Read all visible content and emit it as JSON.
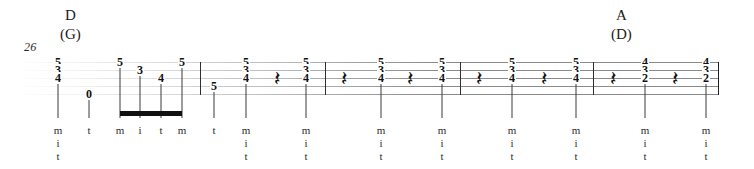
{
  "score": {
    "measure_number": "26",
    "staff": {
      "type": "guitar-tablature",
      "line_count": 5,
      "top_y": 62,
      "line_spacing": 8,
      "left_x": 14,
      "right_x": 719
    },
    "chord_labels": [
      {
        "name": "D",
        "alternate": "(G)",
        "x": 60,
        "y": 8
      },
      {
        "name": "A",
        "alternate": "(D)",
        "x": 611,
        "y": 8
      }
    ],
    "barlines": [
      200,
      325,
      460,
      593,
      718
    ],
    "end_barline": 718,
    "colors": {
      "staff_line": "#8a8a8a",
      "note": "#111111",
      "barline": "#2e2e2e",
      "fingering": "#2b2b2b"
    },
    "measures": [
      {
        "index": 1,
        "events": [
          {
            "kind": "chord",
            "x": 58,
            "frets": [
              {
                "value": "5",
                "string": 1
              },
              {
                "value": "3",
                "string": 2
              },
              {
                "value": "4",
                "string": 3
              }
            ],
            "stem": true,
            "fingering": [
              "m",
              "i",
              "t"
            ]
          },
          {
            "kind": "note",
            "x": 89,
            "frets": [
              {
                "value": "0",
                "string": 5
              }
            ],
            "stem": true,
            "fingering": [
              "t"
            ]
          },
          {
            "kind": "note",
            "x": 120,
            "frets": [
              {
                "value": "5",
                "string": 1
              }
            ],
            "stem": true,
            "beamed": true,
            "fingering": [
              "m"
            ]
          },
          {
            "kind": "note",
            "x": 140,
            "frets": [
              {
                "value": "3",
                "string": 2
              }
            ],
            "stem": true,
            "beamed": true,
            "fingering": [
              "i"
            ]
          },
          {
            "kind": "note",
            "x": 161,
            "frets": [
              {
                "value": "4",
                "string": 3
              }
            ],
            "stem": true,
            "beamed": true,
            "fingering": [
              "t"
            ]
          },
          {
            "kind": "note",
            "x": 182,
            "frets": [
              {
                "value": "5",
                "string": 1
              }
            ],
            "stem": true,
            "beamed": true,
            "fingering": [
              "m"
            ]
          }
        ],
        "beams": [
          {
            "from_x": 120,
            "to_x": 182,
            "y": 111
          }
        ]
      },
      {
        "index": 2,
        "events": [
          {
            "kind": "note",
            "x": 214,
            "frets": [
              {
                "value": "5",
                "string": 4
              }
            ],
            "stem": true,
            "fingering": [
              "t"
            ]
          },
          {
            "kind": "chord",
            "x": 246,
            "frets": [
              {
                "value": "5",
                "string": 1
              },
              {
                "value": "3",
                "string": 2
              },
              {
                "value": "4",
                "string": 3
              }
            ],
            "stem": true,
            "fingering": [
              "m",
              "i",
              "t"
            ]
          },
          {
            "kind": "rest",
            "x": 277,
            "glyph": "𝄽"
          },
          {
            "kind": "chord",
            "x": 306,
            "frets": [
              {
                "value": "5",
                "string": 1
              },
              {
                "value": "3",
                "string": 2
              },
              {
                "value": "4",
                "string": 3
              }
            ],
            "stem": true,
            "fingering": [
              "m",
              "i",
              "t"
            ]
          }
        ],
        "beams": []
      },
      {
        "index": 3,
        "events": [
          {
            "kind": "rest",
            "x": 344,
            "glyph": "𝄽"
          },
          {
            "kind": "chord",
            "x": 381,
            "frets": [
              {
                "value": "5",
                "string": 1
              },
              {
                "value": "3",
                "string": 2
              },
              {
                "value": "4",
                "string": 3
              }
            ],
            "stem": true,
            "fingering": [
              "m",
              "i",
              "t"
            ]
          },
          {
            "kind": "rest",
            "x": 410,
            "glyph": "𝄽"
          },
          {
            "kind": "chord",
            "x": 442,
            "frets": [
              {
                "value": "5",
                "string": 1
              },
              {
                "value": "3",
                "string": 2
              },
              {
                "value": "4",
                "string": 3
              }
            ],
            "stem": true,
            "fingering": [
              "m",
              "i",
              "t"
            ]
          }
        ],
        "beams": []
      },
      {
        "index": 4,
        "events": [
          {
            "kind": "rest",
            "x": 479,
            "glyph": "𝄽"
          },
          {
            "kind": "chord",
            "x": 512,
            "frets": [
              {
                "value": "5",
                "string": 1
              },
              {
                "value": "3",
                "string": 2
              },
              {
                "value": "4",
                "string": 3
              }
            ],
            "stem": true,
            "fingering": [
              "m",
              "i",
              "t"
            ]
          },
          {
            "kind": "rest",
            "x": 544,
            "glyph": "𝄽"
          },
          {
            "kind": "chord",
            "x": 576,
            "frets": [
              {
                "value": "5",
                "string": 1
              },
              {
                "value": "3",
                "string": 2
              },
              {
                "value": "4",
                "string": 3
              }
            ],
            "stem": true,
            "fingering": [
              "m",
              "i",
              "t"
            ]
          }
        ],
        "beams": []
      },
      {
        "index": 5,
        "events": [
          {
            "kind": "rest",
            "x": 613,
            "glyph": "𝄽"
          },
          {
            "kind": "chord",
            "x": 645,
            "frets": [
              {
                "value": "4",
                "string": 1
              },
              {
                "value": "3",
                "string": 2
              },
              {
                "value": "2",
                "string": 3
              }
            ],
            "stem": true,
            "fingering": [
              "m",
              "i",
              "t"
            ]
          },
          {
            "kind": "rest",
            "x": 675,
            "glyph": "𝄽"
          },
          {
            "kind": "chord",
            "x": 706,
            "frets": [
              {
                "value": "4",
                "string": 1
              },
              {
                "value": "3",
                "string": 2
              },
              {
                "value": "2",
                "string": 3
              }
            ],
            "stem": true,
            "fingering": [
              "m",
              "i",
              "t"
            ]
          }
        ],
        "beams": []
      }
    ]
  }
}
